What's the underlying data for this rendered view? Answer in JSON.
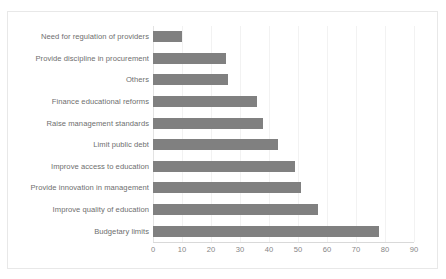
{
  "chart_data": {
    "type": "bar",
    "orientation": "horizontal",
    "title": "",
    "subtitle": "",
    "xlabel": "",
    "ylabel": "",
    "xlim": [
      0,
      90
    ],
    "xticks": [
      0,
      10,
      20,
      30,
      40,
      50,
      60,
      70,
      80,
      90
    ],
    "grid": true,
    "grid_axis": "x",
    "legend": false,
    "legend_position": "none",
    "bar_color": "#808080",
    "categories": [
      "Need for regulation of providers",
      "Provide discipline in procurement",
      "Others",
      "Finance educational reforms",
      "Raise management standards",
      "Limit public debt",
      "Improve access to education",
      "Provide innovation in management",
      "Improve quality of education",
      "Budgetary limits"
    ],
    "values": [
      10,
      25,
      26,
      36,
      38,
      43,
      49,
      51,
      57,
      78
    ],
    "series": [
      {
        "name": "",
        "values": [
          10,
          25,
          26,
          36,
          38,
          43,
          49,
          51,
          57,
          78
        ]
      }
    ]
  },
  "style": {
    "background": "#ffffff",
    "plot_border": "#e8e8e8",
    "gridline_color": "#f2f2f2",
    "axis_color": "#d9d9d9",
    "label_color": "#6e6e6e",
    "tick_color": "#868686"
  }
}
